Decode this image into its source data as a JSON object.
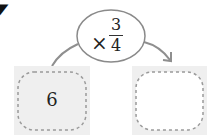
{
  "problem_marker": "7",
  "operator": {
    "symbol": "×",
    "numerator": "3",
    "denominator": "4"
  },
  "start_box": {
    "value": "6"
  },
  "result_box": {
    "value": ""
  },
  "colors": {
    "box_fill": "#efefef",
    "dash": "#9a9a9a",
    "oval_stroke": "#8a8a8a",
    "arrow": "#8f8f8f",
    "text": "#222222"
  }
}
